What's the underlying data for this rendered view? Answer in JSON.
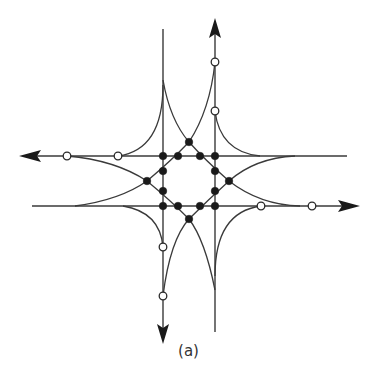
{
  "figure": {
    "caption": "(a)",
    "colors": {
      "line": "#3a3a3a",
      "conflict_point": "#1a1a1a",
      "merge_point_fill": "#ffffff",
      "background": "#ffffff"
    },
    "roads": [
      {
        "id": "northbound",
        "direction": "up",
        "x": 215,
        "y_start": 332,
        "y_end": 20
      },
      {
        "id": "southbound",
        "direction": "down",
        "x": 163,
        "y_start": 29,
        "y_end": 342
      },
      {
        "id": "westbound",
        "direction": "left",
        "y": 156,
        "x_start": 347,
        "x_end": 20
      },
      {
        "id": "eastbound",
        "direction": "right",
        "y": 206,
        "x_start": 32,
        "x_end": 358
      }
    ],
    "conflict_points": [
      [
        189,
        142
      ],
      [
        163,
        156
      ],
      [
        178,
        156
      ],
      [
        200,
        156
      ],
      [
        215,
        156
      ],
      [
        163,
        171
      ],
      [
        215,
        171
      ],
      [
        147,
        181
      ],
      [
        229,
        181
      ],
      [
        163,
        191
      ],
      [
        215,
        191
      ],
      [
        163,
        206
      ],
      [
        178,
        206
      ],
      [
        200,
        206
      ],
      [
        215,
        206
      ],
      [
        189,
        219
      ]
    ],
    "merge_diverge_points": [
      [
        215,
        62
      ],
      [
        215,
        111
      ],
      [
        67,
        156
      ],
      [
        118,
        156
      ],
      [
        261,
        206
      ],
      [
        312,
        206
      ],
      [
        163,
        247
      ],
      [
        163,
        296
      ]
    ],
    "counts": {
      "conflict_points": 16,
      "merge_diverge_points": 8
    }
  }
}
